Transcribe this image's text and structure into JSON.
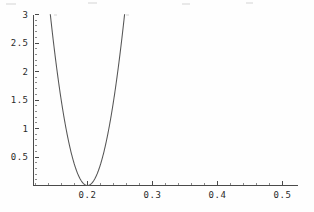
{
  "chart_data": {
    "type": "line",
    "title": "",
    "subtitle": "",
    "xlabel": "",
    "ylabel": "",
    "xlim": [
      0.117,
      0.509
    ],
    "ylim": [
      0.0,
      3.0
    ],
    "grid": false,
    "legend": null,
    "x_ticks": [
      0.2,
      0.3,
      0.4,
      0.5
    ],
    "x_tick_labels": [
      "0.2",
      "0.3",
      "0.4",
      "0.5"
    ],
    "x_minor_step": 0.02,
    "y_ticks": [
      0.5,
      1,
      1.5,
      2,
      2.5,
      3
    ],
    "y_tick_labels": [
      "0.5",
      "1",
      "1.5",
      "2",
      "2.5",
      "3"
    ],
    "y_minor_step": 0.1,
    "series": [
      {
        "name": "parabola",
        "color": "#555555",
        "vertex_x": 0.2,
        "vertex_y": 0.0,
        "curvature": 920,
        "x_start": 0.1428,
        "x_end": 0.2572,
        "x": [
          0.1428,
          0.148,
          0.153,
          0.158,
          0.163,
          0.168,
          0.173,
          0.178,
          0.183,
          0.188,
          0.193,
          0.198,
          0.2,
          0.202,
          0.207,
          0.212,
          0.217,
          0.222,
          0.227,
          0.232,
          0.237,
          0.242,
          0.247,
          0.252,
          0.2572
        ],
        "values": [
          3.0,
          2.53,
          2.11,
          1.73,
          1.38,
          1.07,
          0.8,
          0.57,
          0.38,
          0.22,
          0.11,
          0.0037,
          0.0,
          0.0037,
          0.045,
          0.13,
          0.25,
          0.4,
          0.59,
          0.81,
          1.07,
          1.37,
          1.7,
          2.07,
          3.0
        ]
      }
    ]
  },
  "axes": {
    "x_axis_name": "x-axis",
    "y_axis_name": "y-axis"
  }
}
